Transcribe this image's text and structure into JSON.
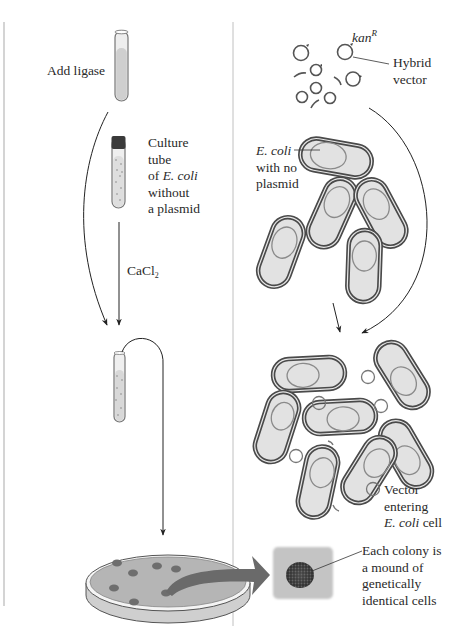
{
  "diagram": {
    "left_panel": {
      "step1_label": "Add  ligase",
      "step2_label": {
        "line1": "Culture",
        "line2": "tube",
        "line3_prefix": "of ",
        "line3_italic": "E. coli",
        "line4": "without",
        "line5": "a plasmid"
      },
      "reagent_label": {
        "main": "CaCl",
        "subscript": "2"
      }
    },
    "right_panel": {
      "gene_label": {
        "main": "kan",
        "superscript": "R"
      },
      "vector_label": {
        "line1": "Hybrid",
        "line2": "vector"
      },
      "cell_label": {
        "line1_italic": "E. coli",
        "line2": "with no",
        "line3": "plasmid"
      },
      "entering_label": {
        "line1": "Vector",
        "line2": "entering",
        "line3_italic": "E. coli",
        "line3_suffix": " cell"
      },
      "colony_label": {
        "line1": "Each colony is",
        "line2": "a mound of",
        "line3": "genetically",
        "line4": "identical cells"
      }
    },
    "colors": {
      "line": "#333333",
      "cell_fill": "#e2e2e2",
      "cell_outline": "#4a4a4a",
      "nucleoid": "#8a8a8a",
      "plate_fill": "#b8b8b8",
      "colony": "#6e6e6e",
      "big_arrow": "#6a6a6a",
      "colony_box": "#c4c4c4",
      "divider": "#b0b0b0"
    }
  }
}
